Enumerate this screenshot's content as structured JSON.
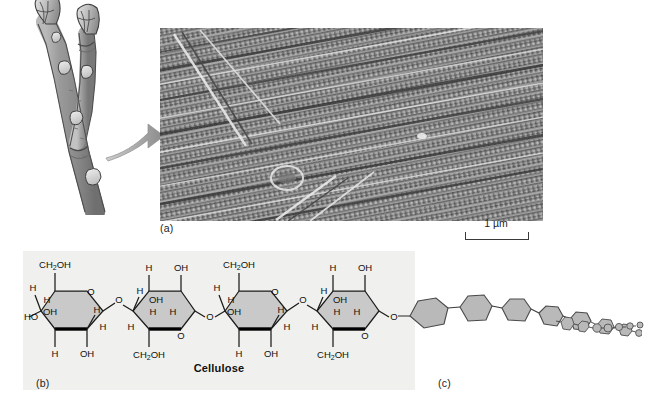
{
  "figure": {
    "background_color": "#ffffff",
    "panels": [
      {
        "id": "a",
        "label": "(a)",
        "content": "scanning electron micrograph of cell wall cellulose microfibrils"
      },
      {
        "id": "b",
        "label": "(b)",
        "content": "Haworth projection of cellulose disaccharide repeating units"
      },
      {
        "id": "c",
        "label": "(c)",
        "content": "simplified glucose-ring polymer chain receding in perspective"
      }
    ]
  },
  "panel_a": {
    "label": "(a)",
    "scale_bar": {
      "length_label": "1 µm",
      "value": 1,
      "unit": "µm"
    },
    "micrograph_fill": "#8d8d8d",
    "illustration_name": "woody-twig-with-buds"
  },
  "panel_b": {
    "label": "(b)",
    "caption": "Cellulose",
    "background_color": "#f0f0ee",
    "ring_fill": "#c9c9c9",
    "ring_count": 4,
    "linkage_label": "O",
    "rings": [
      {
        "index": 0,
        "orientation": "up",
        "labels": {
          "c6": "CH₂OH",
          "ring_oxygen": "O",
          "top_left_h": "H",
          "inner_h": "H",
          "inner_oh": "OH",
          "left_ho": "HO",
          "bottom_h": "H",
          "bottom_oh": "OH",
          "right_h": "H",
          "right_lower_h": "H"
        }
      },
      {
        "index": 1,
        "orientation": "down",
        "labels": {
          "c6": "CH₂OH",
          "ring_oxygen": "O",
          "top_h": "H",
          "top_oh": "OH",
          "inner_oh": "OH",
          "inner_h": "H",
          "left_h": "H",
          "bottom_h": "H",
          "right_h": "H"
        }
      },
      {
        "index": 2,
        "orientation": "up",
        "labels": {
          "c6": "CH₂OH",
          "ring_oxygen": "O",
          "top_left_h": "H",
          "inner_h": "H",
          "inner_oh": "OH",
          "bottom_h": "H",
          "bottom_oh": "OH",
          "right_h": "H",
          "right_lower_h": "H"
        }
      },
      {
        "index": 3,
        "orientation": "down",
        "labels": {
          "c6": "CH₂OH",
          "ring_oxygen": "O",
          "top_h": "H",
          "top_oh": "OH",
          "inner_oh": "OH",
          "inner_h": "H",
          "left_h": "H",
          "bottom_h": "H",
          "right_h": "H"
        }
      }
    ],
    "atom_labels": {
      "hydrogen": "H",
      "hydroxyl": "OH",
      "hydroxyl_left": "HO",
      "oxygen": "O",
      "hydroxymethyl": "CH₂OH"
    }
  },
  "panel_c": {
    "label": "(c)",
    "ring_fill": "#b9b9b9",
    "ring_stroke": "#4a4a4a",
    "unit_count": 16,
    "description": "glucose units shrinking with distance along the cellulose chain"
  }
}
